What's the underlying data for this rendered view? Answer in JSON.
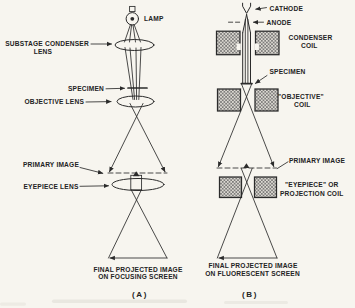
{
  "colors": {
    "background": "#f7f5ef",
    "ink": "#2b2b2b",
    "hatch_line": "#5f5f5f",
    "hatch_bg": "#dcd9d2"
  },
  "panel_a": {
    "caption": "(A)",
    "lamp_label": "LAMP",
    "condenser_label_line1": "SUBSTAGE CONDENSER",
    "condenser_label_line2": "LENS",
    "specimen_label": "SPECIMEN",
    "objective_label": "OBJECTIVE LENS",
    "primary_image_label": "PRIMARY IMAGE",
    "eyepiece_label": "EYEPIECE LENS",
    "final_label_line1": "FINAL PROJECTED IMAGE",
    "final_label_line2": "ON FOCUSING SCREEN"
  },
  "panel_b": {
    "caption": "(B)",
    "cathode_label": "CATHODE",
    "anode_label": "ANODE",
    "condenser_label_line1": "CONDENSER",
    "condenser_label_line2": "COIL",
    "specimen_label": "SPECIMEN",
    "objective_label_line1": "\"OBJECTIVE\"",
    "objective_label_line2": "COIL",
    "primary_image_label": "PRIMARY IMAGE",
    "eyepiece_label_line1": "\"EYEPIECE\" OR",
    "eyepiece_label_line2": "PROJECTION COIL",
    "final_label_line1": "FINAL PROJECTED IMAGE",
    "final_label_line2": "ON FLUORESCENT SCREEN"
  }
}
